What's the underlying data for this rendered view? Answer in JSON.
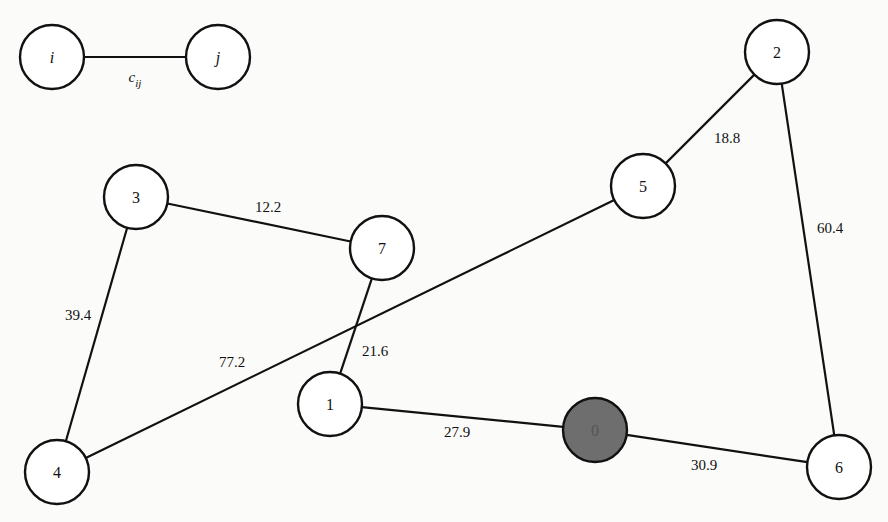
{
  "legend": {
    "from_node": {
      "label": "i",
      "x": 52,
      "y": 57
    },
    "to_node": {
      "label": "j",
      "x": 218,
      "y": 57
    },
    "edge_label": {
      "base": "c",
      "subscript": "ij",
      "x": 135,
      "y": 77
    }
  },
  "style": {
    "node_radius": 32,
    "depot_fill": "#6e6e6e",
    "node_fill": "#ffffff",
    "stroke": "#111111"
  },
  "nodes": [
    {
      "id": "0",
      "label": "0",
      "x": 595,
      "y": 430,
      "depot": true
    },
    {
      "id": "1",
      "label": "1",
      "x": 330,
      "y": 404,
      "depot": false
    },
    {
      "id": "2",
      "label": "2",
      "x": 777,
      "y": 52,
      "depot": false
    },
    {
      "id": "3",
      "label": "3",
      "x": 136,
      "y": 197,
      "depot": false
    },
    {
      "id": "4",
      "label": "4",
      "x": 57,
      "y": 472,
      "depot": false
    },
    {
      "id": "5",
      "label": "5",
      "x": 643,
      "y": 186,
      "depot": false
    },
    {
      "id": "6",
      "label": "6",
      "x": 839,
      "y": 467,
      "depot": false
    },
    {
      "id": "7",
      "label": "7",
      "x": 382,
      "y": 248,
      "depot": false
    }
  ],
  "edges": [
    {
      "from": "3",
      "to": "7",
      "weight": "12.2",
      "lx": 268,
      "ly": 207
    },
    {
      "from": "3",
      "to": "4",
      "weight": "39.4",
      "lx": 78,
      "ly": 315
    },
    {
      "from": "7",
      "to": "1",
      "weight": "21.6",
      "lx": 375,
      "ly": 351
    },
    {
      "from": "4",
      "to": "5",
      "weight": "77.2",
      "lx": 232,
      "ly": 362
    },
    {
      "from": "5",
      "to": "2",
      "weight": "18.8",
      "lx": 727,
      "ly": 138
    },
    {
      "from": "2",
      "to": "6",
      "weight": "60.4",
      "lx": 830,
      "ly": 228
    },
    {
      "from": "1",
      "to": "0",
      "weight": "27.9",
      "lx": 457,
      "ly": 432
    },
    {
      "from": "0",
      "to": "6",
      "weight": "30.9",
      "lx": 704,
      "ly": 465
    }
  ]
}
